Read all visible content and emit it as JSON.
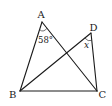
{
  "diagram": {
    "type": "geometry",
    "points": {
      "A": {
        "label": "A"
      },
      "B": {
        "label": "B"
      },
      "C": {
        "label": "C"
      },
      "D": {
        "label": "D"
      }
    },
    "segments": [
      [
        "A",
        "B"
      ],
      [
        "A",
        "C"
      ],
      [
        "B",
        "C"
      ],
      [
        "B",
        "D"
      ],
      [
        "D",
        "C"
      ]
    ],
    "angles": [
      {
        "vertex": "A",
        "between": [
          "B",
          "C"
        ],
        "label": "58°"
      },
      {
        "vertex": "D",
        "between": [
          "B",
          "C"
        ],
        "label": "x"
      }
    ],
    "colors": {
      "stroke": "#1a1a1a",
      "background": "#ffffff"
    }
  }
}
